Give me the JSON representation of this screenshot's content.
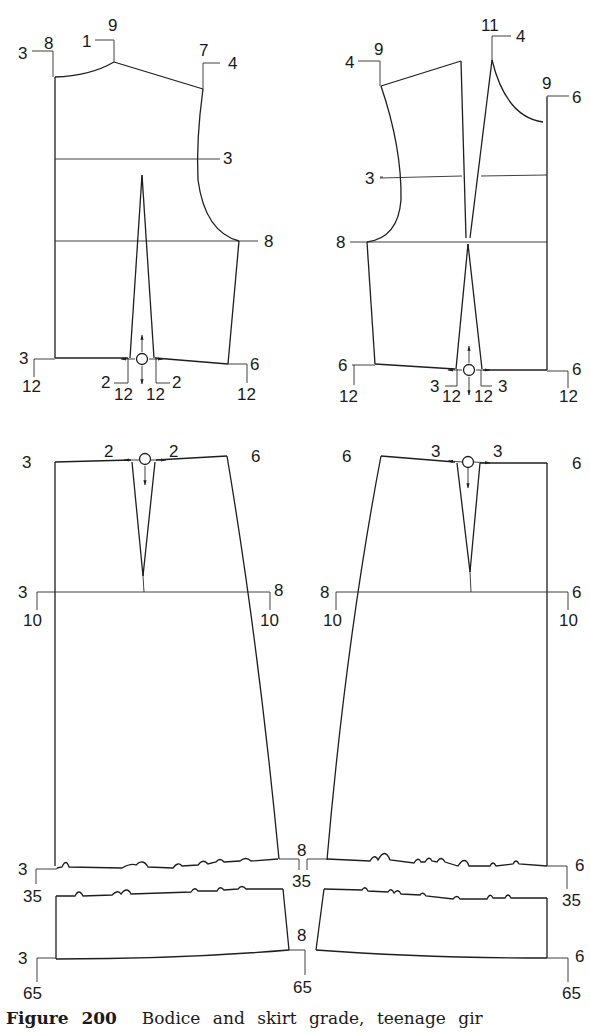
{
  "figure": {
    "caption_number": "Figure 200",
    "caption_text": "Bodice and skirt grade, teenage gir"
  },
  "bodice_front": {
    "name": "Bodice front (left upper)",
    "labels": {
      "cf_neck_a": "3",
      "cf_neck_b": "8",
      "neck_shoulder_a": "1",
      "neck_shoulder_b": "9",
      "shoulder_tip_a": "7",
      "shoulder_tip_b": "4",
      "chest_line": "3",
      "underarm": "8",
      "waist_cf_a": "3",
      "waist_cf_b": "12",
      "dart_left_a": "2",
      "dart_left_b": "12",
      "dart_right_a": "2",
      "dart_right_b": "12",
      "waist_side_a": "6",
      "waist_side_b": "12"
    }
  },
  "bodice_back": {
    "name": "Bodice back (right upper)",
    "labels": {
      "shoulder_tip_a": "4",
      "shoulder_tip_b": "9",
      "neck_shoulder_a": "11",
      "neck_shoulder_b": "4",
      "cb_neck_a": "9",
      "cb_neck_b": "6",
      "chest_line": "3",
      "underarm": "8",
      "waist_side_a": "6",
      "waist_side_b": "12",
      "dart_left_a": "3",
      "dart_left_b": "12",
      "dart_right_a": "3",
      "dart_right_b": "12",
      "waist_cb_a": "6",
      "waist_cb_b": "12"
    }
  },
  "skirt_front": {
    "name": "Skirt front (left lower)",
    "labels": {
      "waist_cf": "3",
      "dart_left": "2",
      "dart_right": "2",
      "waist_side": "6",
      "hip_cf_a": "3",
      "hip_cf_b": "10",
      "hip_side_a": "8",
      "hip_side_b": "10",
      "break_cf_a": "3",
      "break_cf_b": "35",
      "break_side_a": "8",
      "break_side_b": "35",
      "hem_cf_a": "3",
      "hem_cf_b": "65",
      "hem_side_a": "8",
      "hem_side_b": "65"
    }
  },
  "skirt_back": {
    "name": "Skirt back (right lower)",
    "labels": {
      "waist_side": "6",
      "dart_left": "3",
      "dart_right": "3",
      "waist_cb": "6",
      "hip_side_a": "8",
      "hip_side_b": "10",
      "hip_cb_a": "6",
      "hip_cb_b": "10",
      "break_cb_a": "6",
      "break_cb_b": "35",
      "hem_cb_a": "6",
      "hem_cb_b": "65"
    }
  },
  "colors": {
    "line": "#1e1e1e",
    "background": "#ffffff"
  }
}
